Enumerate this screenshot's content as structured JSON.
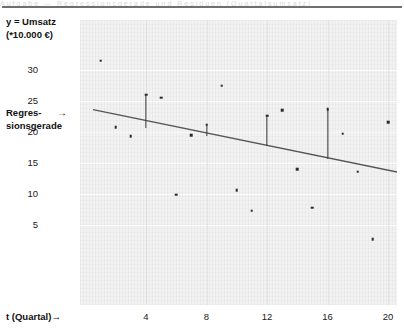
{
  "header": {
    "ghost_text": "Aufgabe — Regressionsgerade und Residuen (Quartalsumsatz)"
  },
  "axis": {
    "y_label_line1": "y = Umsatz",
    "y_label_line2": "(*10.000 €)",
    "x_label": "t (Quartal)→",
    "y_ticks": [
      30,
      25,
      20,
      15,
      10,
      5
    ],
    "x_ticks": [
      4,
      8,
      12,
      16,
      20
    ]
  },
  "annotation": {
    "regression_line1": "Regres-",
    "regression_line2": "sionsgerade",
    "arrow": "→"
  },
  "colors": {
    "plot_background": "#f2f2f2",
    "gridline": "#ffffff",
    "point": "#2a2a2a",
    "regression_line": "#555555",
    "residual_stem": "#3a3a3a",
    "text": "#111111"
  },
  "chart_data": {
    "type": "scatter",
    "title": "",
    "xlabel": "t (Quartal)→",
    "ylabel": "y = Umsatz (*10.000 €)",
    "xlim": [
      0,
      21
    ],
    "ylim": [
      0,
      34
    ],
    "grid": true,
    "legend": "none",
    "x": [
      1,
      2,
      3,
      4,
      5,
      6,
      7,
      8,
      9,
      10,
      11,
      12,
      13,
      14,
      15,
      16,
      17,
      18,
      19,
      20
    ],
    "values": [
      31.5,
      20.8,
      19.3,
      26.0,
      25.5,
      9.9,
      19.5,
      21.2,
      27.5,
      10.6,
      7.3,
      22.6,
      23.5,
      14.0,
      7.8,
      23.7,
      19.7,
      13.6,
      2.7,
      21.6
    ],
    "series": [
      {
        "name": "Umsatz (Beobachtung)",
        "type": "scatter",
        "values": [
          31.5,
          20.8,
          19.3,
          26.0,
          25.5,
          9.9,
          19.5,
          21.2,
          27.5,
          10.6,
          7.3,
          22.6,
          23.5,
          14.0,
          7.8,
          23.7,
          19.7,
          13.6,
          2.7,
          21.6
        ]
      },
      {
        "name": "Regressionsgerade",
        "type": "line",
        "endpoints": [
          {
            "t": 0.5,
            "y": 23.6
          },
          {
            "t": 20.9,
            "y": 13.4
          }
        ],
        "slope": -0.5,
        "intercept": 23.85
      }
    ],
    "residual_stems": [
      {
        "t": 4,
        "y_observed": 26.0,
        "y_fitted": 20.6
      },
      {
        "t": 8,
        "y_observed": 21.2,
        "y_fitted": 19.3
      },
      {
        "t": 12,
        "y_observed": 22.6,
        "y_fitted": 17.8
      },
      {
        "t": 16,
        "y_observed": 23.7,
        "y_fitted": 15.6
      }
    ],
    "annotations": [
      {
        "text": "Regressionsgerade",
        "points_to": "regression-line"
      }
    ]
  }
}
